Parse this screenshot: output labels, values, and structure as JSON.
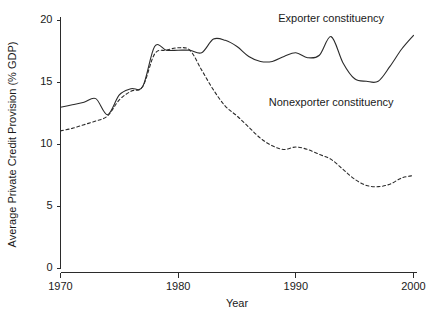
{
  "chart_data": {
    "type": "line",
    "title": "",
    "xlabel": "Year",
    "ylabel": "Average Private Credit Provision (% GDP)",
    "xlim": [
      1970,
      2000
    ],
    "ylim": [
      0,
      20
    ],
    "xticks": [
      1970,
      1980,
      1990,
      2000
    ],
    "yticks": [
      0,
      5,
      10,
      15,
      20
    ],
    "xtick_labels": [
      "1970",
      "1980",
      "1990",
      "2000"
    ],
    "ytick_labels": [
      "0",
      "5",
      "10",
      "15",
      "20"
    ],
    "grid": false,
    "legend_position": "inline-annotation",
    "x": [
      1970,
      1971,
      1972,
      1973,
      1974,
      1975,
      1976,
      1977,
      1978,
      1979,
      1980,
      1981,
      1982,
      1983,
      1984,
      1985,
      1986,
      1987,
      1988,
      1989,
      1990,
      1991,
      1992,
      1993,
      1994,
      1995,
      1996,
      1997,
      1998,
      1999,
      2000
    ],
    "series": [
      {
        "name": "Exporter constituency",
        "style": "solid",
        "color": "#2b2b2b",
        "values": [
          13.0,
          13.2,
          13.4,
          13.7,
          12.4,
          14.0,
          14.5,
          14.7,
          17.9,
          17.6,
          17.6,
          17.6,
          17.4,
          18.5,
          18.4,
          17.9,
          17.1,
          16.7,
          16.7,
          17.1,
          17.4,
          17.0,
          17.2,
          18.7,
          16.6,
          15.3,
          15.1,
          15.1,
          16.3,
          17.7,
          18.8
        ]
      },
      {
        "name": "Nonexporter constituency",
        "style": "dashed",
        "color": "#2b2b2b",
        "values": [
          11.1,
          11.3,
          11.6,
          11.9,
          12.3,
          13.6,
          14.3,
          14.7,
          17.3,
          17.6,
          17.8,
          17.6,
          16.0,
          14.4,
          13.1,
          12.3,
          11.4,
          10.5,
          9.9,
          9.6,
          9.8,
          9.6,
          9.2,
          8.8,
          8.0,
          7.2,
          6.7,
          6.6,
          6.8,
          7.3,
          7.5
        ]
      }
    ],
    "annotations": [
      {
        "text": "Exporter constituency",
        "x": 1993,
        "y": 19.9
      },
      {
        "text": "Nonexporter constituency",
        "x": 1993,
        "y": 13.1
      }
    ]
  }
}
